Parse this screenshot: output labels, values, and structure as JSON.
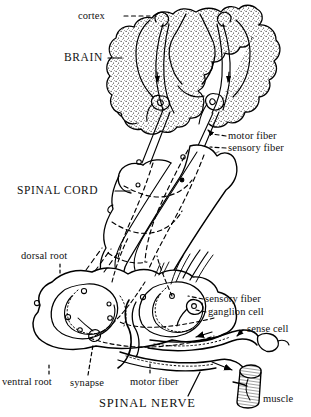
{
  "figure": {
    "background_color": "#ffffff",
    "ink_color": "#000000",
    "labels": {
      "cortex": "cortex",
      "brain": "BRAIN",
      "motor_fiber_upper": "motor fiber",
      "sensory_fiber_upper": "sensory fiber",
      "spinal_cord": "SPINAL CORD",
      "dorsal_root": "dorsal root",
      "sensory_fiber_lower": "sensory fiber",
      "ganglion_cell": "ganglion cell",
      "sense_cell": "sense cell",
      "ventral_root": "ventral root",
      "synapse": "synapse",
      "motor_fiber_lower": "motor fiber",
      "spinal_nerve": "SPINAL NERVE",
      "muscle": "muscle"
    },
    "leader_arrows": {
      "brain": "→",
      "spinal_cord": "→"
    },
    "structures": [
      "brain-hemispheres",
      "cerebral-cortex-stipple",
      "spinal-cord-tube",
      "spinal-cord-cross-section",
      "dorsal-root",
      "ventral-root",
      "ganglion-cell",
      "sense-cell",
      "synapse",
      "motor-fiber-tract",
      "sensory-fiber-tract",
      "muscle-bundle"
    ]
  }
}
